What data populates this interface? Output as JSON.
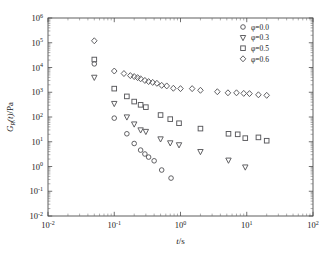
{
  "figure": {
    "background": "#ffffff",
    "frame_color": "#4d4d4d",
    "marker_color": "#58585c"
  },
  "chart_data": {
    "type": "scatter",
    "title": "",
    "subtitle": "",
    "xlabel": "t/s",
    "ylabel": "G_R(t)/Pa",
    "xlabel_parts": {
      "italic": "t",
      "plain": "/s"
    },
    "ylabel_parts": {
      "italic": "G",
      "sub": "R",
      "italic2": "(t)",
      "plain": "/Pa"
    },
    "xscale": "log",
    "yscale": "log",
    "xlim": [
      0.01,
      100
    ],
    "ylim": [
      0.01,
      1000000
    ],
    "grid": false,
    "xticks": [
      0.01,
      0.1,
      1,
      10,
      100
    ],
    "xtick_labels": [
      "10-2",
      "10-1",
      "100",
      "101",
      "102"
    ],
    "xtick_mantissa": [
      "10",
      "10",
      "10",
      "10",
      "10"
    ],
    "xtick_exponents": [
      "-2",
      "-1",
      "0",
      "1",
      "2"
    ],
    "yticks": [
      0.01,
      0.1,
      1,
      10,
      100,
      1000,
      10000,
      100000,
      1000000
    ],
    "ytick_mantissa": [
      "10",
      "10",
      "10",
      "10",
      "10",
      "10",
      "10",
      "10",
      "10"
    ],
    "ytick_exponents": [
      "-2",
      "-1",
      "0",
      "1",
      "2",
      "3",
      "4",
      "5",
      "6"
    ],
    "minor_ticks": true,
    "legend": {
      "position": "top-right",
      "border": false,
      "entries": [
        {
          "label": "φ=0.0",
          "marker": "circle",
          "series": 0
        },
        {
          "label": "φ=0.3",
          "marker": "triangle-down",
          "series": 1
        },
        {
          "label": "φ=0.5",
          "marker": "square",
          "series": 2
        },
        {
          "label": "φ=0.6",
          "marker": "diamond",
          "series": 3
        }
      ]
    },
    "series": [
      {
        "name": "φ=0.0",
        "marker": "circle",
        "points": [
          [
            0.05,
            14000
          ],
          [
            0.1,
            90
          ],
          [
            0.155,
            21
          ],
          [
            0.2,
            8.5
          ],
          [
            0.25,
            4.6
          ],
          [
            0.29,
            3.2
          ],
          [
            0.33,
            2.4
          ],
          [
            0.4,
            1.7
          ],
          [
            0.52,
            0.72
          ],
          [
            0.72,
            0.34
          ]
        ]
      },
      {
        "name": "φ=0.3",
        "marker": "triangle-down",
        "points": [
          [
            0.05,
            4000
          ],
          [
            0.1,
            350
          ],
          [
            0.155,
            100
          ],
          [
            0.2,
            52
          ],
          [
            0.25,
            30
          ],
          [
            0.3,
            26
          ],
          [
            0.5,
            13
          ],
          [
            0.7,
            9
          ],
          [
            0.95,
            7.5
          ],
          [
            2.0,
            4.0
          ],
          [
            5.3,
            1.8
          ],
          [
            9.5,
            0.95
          ]
        ]
      },
      {
        "name": "φ=0.5",
        "marker": "square",
        "points": [
          [
            0.05,
            21000
          ],
          [
            0.1,
            1400
          ],
          [
            0.155,
            680
          ],
          [
            0.2,
            420
          ],
          [
            0.25,
            310
          ],
          [
            0.3,
            250
          ],
          [
            0.5,
            120
          ],
          [
            0.7,
            82
          ],
          [
            0.95,
            56
          ],
          [
            2.0,
            34
          ],
          [
            5.3,
            21
          ],
          [
            7.3,
            20
          ],
          [
            9.5,
            14
          ],
          [
            15.0,
            15
          ],
          [
            20.0,
            11
          ]
        ]
      },
      {
        "name": "φ=0.6",
        "marker": "diamond",
        "points": [
          [
            0.05,
            120000
          ],
          [
            0.1,
            7200
          ],
          [
            0.14,
            5700
          ],
          [
            0.175,
            4700
          ],
          [
            0.2,
            4300
          ],
          [
            0.225,
            3900
          ],
          [
            0.25,
            3500
          ],
          [
            0.29,
            3000
          ],
          [
            0.33,
            2700
          ],
          [
            0.38,
            2500
          ],
          [
            0.44,
            2300
          ],
          [
            0.52,
            1900
          ],
          [
            0.62,
            1800
          ],
          [
            0.78,
            1450
          ],
          [
            1.0,
            1400
          ],
          [
            1.5,
            1400
          ],
          [
            2.0,
            1200
          ],
          [
            3.6,
            1050
          ],
          [
            5.2,
            950
          ],
          [
            7.0,
            950
          ],
          [
            9.0,
            900
          ],
          [
            11.0,
            880
          ],
          [
            15.0,
            790
          ],
          [
            20.0,
            750
          ]
        ]
      }
    ]
  }
}
